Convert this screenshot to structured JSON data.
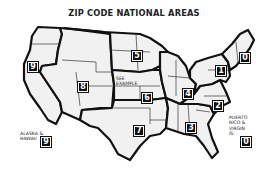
{
  "title": "ZIP CODE NATIONAL AREAS",
  "colors": {
    "background": "#ffffff",
    "region_fill": "#f1f1f1",
    "border": "#111111",
    "badge": "#111111"
  },
  "areas": [
    {
      "id": "0",
      "label": "0",
      "description": "New England"
    },
    {
      "id": "1",
      "label": "1",
      "description": "New York / Pennsylvania"
    },
    {
      "id": "2",
      "label": "2",
      "description": "Mid-Atlantic / Virginia / Carolinas"
    },
    {
      "id": "3",
      "label": "3",
      "description": "Southeast"
    },
    {
      "id": "4",
      "label": "4",
      "description": "Ohio Valley / Great Lakes"
    },
    {
      "id": "5",
      "label": "5",
      "description": "Upper Midwest"
    },
    {
      "id": "6",
      "label": "6",
      "description": "Central Plains"
    },
    {
      "id": "7",
      "label": "7",
      "description": "South Central"
    },
    {
      "id": "8",
      "label": "8",
      "description": "Mountain West"
    },
    {
      "id": "9",
      "label": "9",
      "description": "Pacific"
    }
  ],
  "annotations": {
    "see_example": "SEE EXAMPLE",
    "alaska_hawaii": {
      "line1": "ALASKA &",
      "line2": "HAWAII",
      "area": "9"
    },
    "puerto_rico": {
      "line1": "PUERTO",
      "line2": "RICO &",
      "line3": "VIRGIN",
      "line4": "IS.",
      "area": "0"
    }
  }
}
